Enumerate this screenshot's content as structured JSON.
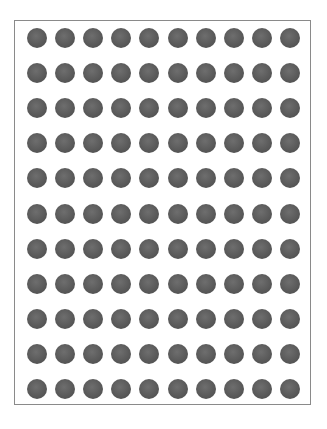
{
  "grid": {
    "rows": 11,
    "cols": 10,
    "first_center_x": 37,
    "first_center_y": 38,
    "col_spacing": 28.1,
    "row_spacing": 35.1,
    "dot_diameter": 20,
    "dot_color": "#5a5a5a",
    "frame_color": "#8a8a8a"
  }
}
